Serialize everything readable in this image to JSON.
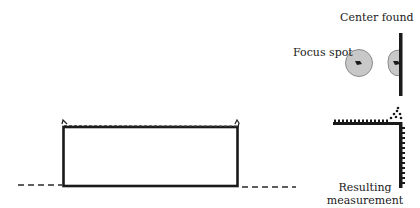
{
  "labels": {
    "center_found": "Center found",
    "focus_spot": "Focus spot",
    "resulting_line1": "Resulting",
    "resulting_line2": "measurement"
  },
  "colors": {
    "stroke": "#1a1a1a",
    "spot_fill": "#c8c8c8",
    "spot_stroke": "#8a8a8a"
  }
}
